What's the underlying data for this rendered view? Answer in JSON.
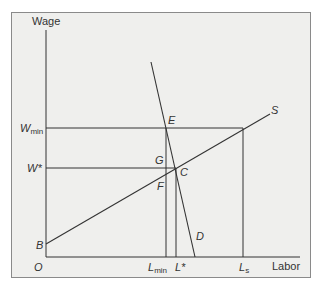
{
  "axes": {
    "y_label": "Wage",
    "x_label": "Labor",
    "origin_label": "O"
  },
  "y_ticks": [
    {
      "main": "W",
      "sub": "min"
    },
    {
      "main": "W*",
      "sub": ""
    }
  ],
  "x_ticks": [
    {
      "main": "L",
      "sub": "min"
    },
    {
      "main": "L*",
      "sub": ""
    },
    {
      "main": "L",
      "sub": "s"
    }
  ],
  "curves": {
    "supply": "S",
    "demand": "D",
    "supply_intercept": "B"
  },
  "points": {
    "E": "E",
    "C": "C",
    "G": "G",
    "F": "F"
  },
  "colors": {
    "background": "#efefed",
    "line": "#333333",
    "frame": "#8a8a8a"
  }
}
